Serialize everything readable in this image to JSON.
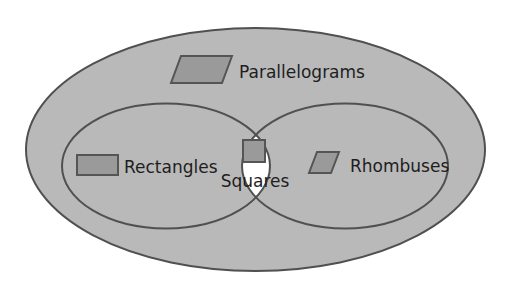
{
  "diagram": {
    "colors": {
      "background": "#ffffff",
      "region_fill": "#b9b9b9",
      "intersection_fill": "#ffffff",
      "stroke": "#505050",
      "shape_fill": "#9a9a9a",
      "shape_stroke": "#555555",
      "text": "#1e1e1e"
    },
    "sets": [
      {
        "id": "parallelograms",
        "label": "Parallelograms",
        "icon": "parallelogram-icon"
      },
      {
        "id": "rectangles",
        "label": "Rectangles",
        "icon": "rectangle-icon"
      },
      {
        "id": "rhombuses",
        "label": "Rhombuses",
        "icon": "rhombus-icon"
      },
      {
        "id": "squares",
        "label": "Squares",
        "icon": "square-icon"
      }
    ],
    "relationships": [
      "Rectangles ⊂ Parallelograms",
      "Rhombuses ⊂ Parallelograms",
      "Squares = Rectangles ∩ Rhombuses"
    ]
  }
}
